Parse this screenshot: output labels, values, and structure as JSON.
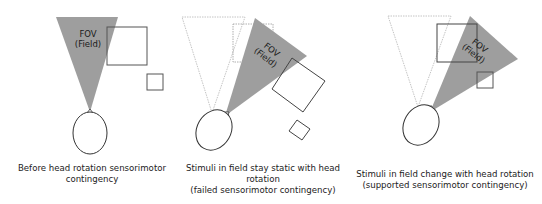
{
  "colors": {
    "fov_fill": "#9e9e9e",
    "stroke": "#333333",
    "ghost_stroke": "#b5b5b5"
  },
  "fov_label": {
    "line1": "FOV",
    "line2": "(Field)"
  },
  "panels": [
    {
      "id": "before",
      "caption": [
        "Before head rotation sensorimotor",
        "contingency"
      ]
    },
    {
      "id": "failed",
      "caption": [
        "Stimuli in field stay static with head",
        "rotation",
        "(failed sensorimotor contingency)"
      ]
    },
    {
      "id": "supported",
      "caption": [
        "Stimuli in field change with head rotation",
        "(supported sensorimotor contingency)"
      ]
    }
  ]
}
